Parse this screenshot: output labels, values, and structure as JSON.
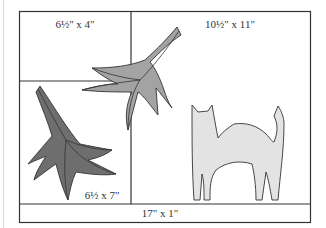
{
  "diagram": {
    "type": "quilt-layout",
    "sections": [
      {
        "id": "top-left",
        "label": "6½\" x 4\""
      },
      {
        "id": "top-right",
        "label": "10½\" x 11\""
      },
      {
        "id": "bottom-left",
        "label": "6½ x 7\""
      },
      {
        "id": "bottom-strip",
        "label": "17\" x 1\""
      }
    ],
    "shapes": [
      {
        "id": "leaf-medium-gray",
        "color": "#a3a3a3"
      },
      {
        "id": "leaf-dark-gray",
        "color": "#6e6e6e"
      },
      {
        "id": "cat",
        "color": "#e3e3e3"
      }
    ],
    "colors": {
      "outline": "#333333",
      "background": "#ffffff"
    }
  }
}
